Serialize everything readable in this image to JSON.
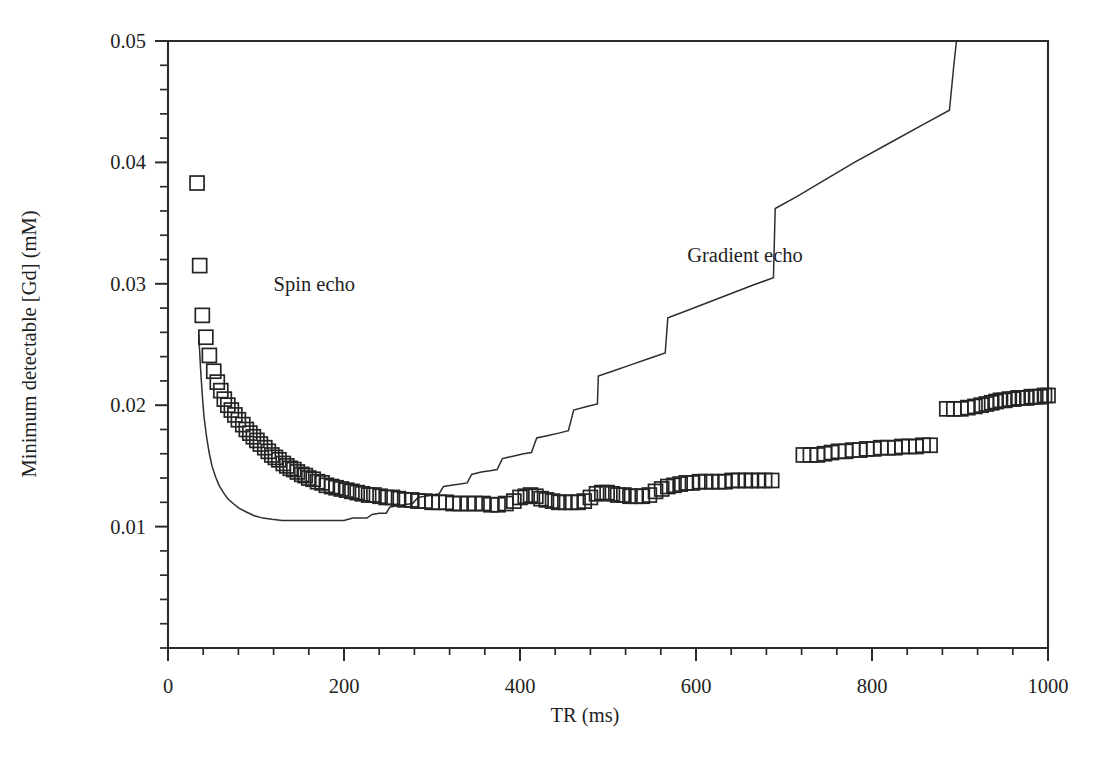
{
  "chart_data": {
    "type": "scatter",
    "title": "",
    "xlabel": "TR (ms)",
    "ylabel": "Minimum detectable [Gd] (mM)",
    "xlim": [
      0,
      1000
    ],
    "ylim": [
      0,
      0.05
    ],
    "grid": false,
    "legend_position": "inline-annotations",
    "x_ticks": [
      0,
      200,
      400,
      600,
      800,
      1000
    ],
    "x_tick_labels": [
      "0",
      "200",
      "400",
      "600",
      "800",
      "1000"
    ],
    "x_minor_tick_interval": 40,
    "y_ticks": [
      0.01,
      0.02,
      0.03,
      0.04,
      0.05
    ],
    "y_tick_labels": [
      "0.01",
      "0.02",
      "0.03",
      "0.04",
      "0.05"
    ],
    "y_minor_tick_interval": 0.002,
    "annotations": [
      {
        "text": "Spin echo",
        "x": 120,
        "y": 0.0294
      },
      {
        "text": "Gradient echo",
        "x": 590,
        "y": 0.0318
      }
    ],
    "series": [
      {
        "name": "Spin echo",
        "marker": "open-square",
        "marker_size": 14,
        "render": "markers",
        "points": [
          [
            33,
            0.0383
          ],
          [
            36,
            0.0315
          ],
          [
            39,
            0.0274
          ],
          [
            43,
            0.0256
          ],
          [
            47,
            0.0241
          ],
          [
            52,
            0.0228
          ],
          [
            56,
            0.0219
          ],
          [
            60,
            0.0212
          ],
          [
            64,
            0.0205
          ],
          [
            68,
            0.02
          ],
          [
            72,
            0.0196
          ],
          [
            76,
            0.0192
          ],
          [
            80,
            0.0188
          ],
          [
            85,
            0.0184
          ],
          [
            89,
            0.018
          ],
          [
            93,
            0.0177
          ],
          [
            97,
            0.0174
          ],
          [
            101,
            0.0171
          ],
          [
            105,
            0.0168
          ],
          [
            110,
            0.0165
          ],
          [
            114,
            0.0162
          ],
          [
            118,
            0.0159
          ],
          [
            122,
            0.0157
          ],
          [
            126,
            0.0155
          ],
          [
            131,
            0.0152
          ],
          [
            135,
            0.015
          ],
          [
            139,
            0.0148
          ],
          [
            143,
            0.0147
          ],
          [
            147,
            0.0145
          ],
          [
            152,
            0.0143
          ],
          [
            156,
            0.0142
          ],
          [
            160,
            0.014
          ],
          [
            165,
            0.0139
          ],
          [
            170,
            0.0137
          ],
          [
            175,
            0.0136
          ],
          [
            180,
            0.0134
          ],
          [
            186,
            0.0133
          ],
          [
            191,
            0.0132
          ],
          [
            197,
            0.0131
          ],
          [
            203,
            0.013
          ],
          [
            209,
            0.0129
          ],
          [
            215,
            0.0128
          ],
          [
            221,
            0.0127
          ],
          [
            228,
            0.0126
          ],
          [
            234,
            0.0126
          ],
          [
            241,
            0.0125
          ],
          [
            248,
            0.0124
          ],
          [
            255,
            0.0124
          ],
          [
            262,
            0.0123
          ],
          [
            269,
            0.0122
          ],
          [
            277,
            0.0122
          ],
          [
            284,
            0.0121
          ],
          [
            292,
            0.0121
          ],
          [
            300,
            0.012
          ],
          [
            308,
            0.012
          ],
          [
            316,
            0.012
          ],
          [
            324,
            0.0119
          ],
          [
            332,
            0.0119
          ],
          [
            341,
            0.0119
          ],
          [
            349,
            0.0119
          ],
          [
            358,
            0.0119
          ],
          [
            367,
            0.0118
          ],
          [
            375,
            0.0118
          ],
          [
            384,
            0.0119
          ],
          [
            393,
            0.0121
          ],
          [
            400,
            0.0124
          ],
          [
            406,
            0.0125
          ],
          [
            412,
            0.0126
          ],
          [
            418,
            0.0125
          ],
          [
            424,
            0.0123
          ],
          [
            430,
            0.0122
          ],
          [
            437,
            0.0121
          ],
          [
            444,
            0.012
          ],
          [
            451,
            0.012
          ],
          [
            458,
            0.012
          ],
          [
            466,
            0.012
          ],
          [
            473,
            0.0121
          ],
          [
            480,
            0.0124
          ],
          [
            487,
            0.0127
          ],
          [
            493,
            0.0128
          ],
          [
            499,
            0.0128
          ],
          [
            505,
            0.0127
          ],
          [
            511,
            0.0126
          ],
          [
            518,
            0.0126
          ],
          [
            525,
            0.0125
          ],
          [
            532,
            0.0125
          ],
          [
            539,
            0.0125
          ],
          [
            547,
            0.0126
          ],
          [
            554,
            0.0129
          ],
          [
            561,
            0.0131
          ],
          [
            568,
            0.0133
          ],
          [
            575,
            0.0134
          ],
          [
            582,
            0.0135
          ],
          [
            589,
            0.0136
          ],
          [
            596,
            0.0136
          ],
          [
            604,
            0.0137
          ],
          [
            611,
            0.0137
          ],
          [
            618,
            0.0137
          ],
          [
            626,
            0.0137
          ],
          [
            633,
            0.0137
          ],
          [
            641,
            0.0138
          ],
          [
            648,
            0.0138
          ],
          [
            656,
            0.0138
          ],
          [
            663,
            0.0138
          ],
          [
            671,
            0.0138
          ],
          [
            678,
            0.0138
          ],
          [
            686,
            0.0138
          ],
          [
            722,
            0.0159
          ],
          [
            730,
            0.0159
          ],
          [
            738,
            0.0159
          ],
          [
            746,
            0.016
          ],
          [
            754,
            0.0161
          ],
          [
            762,
            0.0162
          ],
          [
            770,
            0.0162
          ],
          [
            778,
            0.0163
          ],
          [
            786,
            0.0163
          ],
          [
            794,
            0.0164
          ],
          [
            802,
            0.0164
          ],
          [
            810,
            0.0165
          ],
          [
            818,
            0.0165
          ],
          [
            826,
            0.0165
          ],
          [
            834,
            0.0166
          ],
          [
            842,
            0.0166
          ],
          [
            850,
            0.0166
          ],
          [
            858,
            0.0167
          ],
          [
            866,
            0.0167
          ],
          [
            885,
            0.0197
          ],
          [
            893,
            0.0197
          ],
          [
            901,
            0.0197
          ],
          [
            909,
            0.0198
          ],
          [
            917,
            0.0199
          ],
          [
            924,
            0.02
          ],
          [
            930,
            0.0201
          ],
          [
            936,
            0.0202
          ],
          [
            941,
            0.0203
          ],
          [
            946,
            0.0204
          ],
          [
            951,
            0.0204
          ],
          [
            956,
            0.0205
          ],
          [
            961,
            0.0205
          ],
          [
            966,
            0.0206
          ],
          [
            971,
            0.0206
          ],
          [
            976,
            0.0206
          ],
          [
            981,
            0.0207
          ],
          [
            986,
            0.0207
          ],
          [
            991,
            0.0207
          ],
          [
            996,
            0.0208
          ],
          [
            1000,
            0.0208
          ]
        ]
      },
      {
        "name": "Gradient echo",
        "marker": "none",
        "render": "line",
        "points": [
          [
            35,
            0.0258
          ],
          [
            37,
            0.023
          ],
          [
            39,
            0.0208
          ],
          [
            41,
            0.019
          ],
          [
            44,
            0.0173
          ],
          [
            47,
            0.016
          ],
          [
            50,
            0.015
          ],
          [
            54,
            0.0141
          ],
          [
            58,
            0.0134
          ],
          [
            63,
            0.0128
          ],
          [
            68,
            0.0123
          ],
          [
            74,
            0.0119
          ],
          [
            81,
            0.0115
          ],
          [
            89,
            0.0112
          ],
          [
            98,
            0.0109
          ],
          [
            108,
            0.0107
          ],
          [
            118,
            0.0106
          ],
          [
            130,
            0.0105
          ],
          [
            145,
            0.0105
          ],
          [
            165,
            0.0105
          ],
          [
            185,
            0.0105
          ],
          [
            200,
            0.0105
          ],
          [
            210,
            0.0107
          ],
          [
            218,
            0.0107
          ],
          [
            226,
            0.0107
          ],
          [
            232,
            0.011
          ],
          [
            240,
            0.0111
          ],
          [
            248,
            0.0111
          ],
          [
            252,
            0.0116
          ],
          [
            258,
            0.0117
          ],
          [
            268,
            0.0118
          ],
          [
            278,
            0.0119
          ],
          [
            284,
            0.0124
          ],
          [
            292,
            0.0125
          ],
          [
            300,
            0.0126
          ],
          [
            308,
            0.0127
          ],
          [
            313,
            0.0133
          ],
          [
            322,
            0.0134
          ],
          [
            332,
            0.0135
          ],
          [
            340,
            0.0136
          ],
          [
            345,
            0.0143
          ],
          [
            356,
            0.0145
          ],
          [
            366,
            0.0146
          ],
          [
            374,
            0.0147
          ],
          [
            380,
            0.0156
          ],
          [
            392,
            0.0158
          ],
          [
            404,
            0.016
          ],
          [
            413,
            0.0161
          ],
          [
            419,
            0.0173
          ],
          [
            432,
            0.0175
          ],
          [
            444,
            0.0177
          ],
          [
            455,
            0.0179
          ],
          [
            461,
            0.0196
          ],
          [
            476,
            0.0199
          ],
          [
            488,
            0.0201
          ],
          [
            489,
            0.0224
          ],
          [
            505,
            0.0228
          ],
          [
            525,
            0.0233
          ],
          [
            545,
            0.0238
          ],
          [
            565,
            0.0243
          ],
          [
            568,
            0.0272
          ],
          [
            590,
            0.0278
          ],
          [
            615,
            0.0285
          ],
          [
            640,
            0.0292
          ],
          [
            665,
            0.0299
          ],
          [
            688,
            0.0305
          ],
          [
            690,
            0.0362
          ],
          [
            715,
            0.0372
          ],
          [
            745,
            0.0385
          ],
          [
            780,
            0.04
          ],
          [
            820,
            0.0416
          ],
          [
            860,
            0.0432
          ],
          [
            888,
            0.0443
          ],
          [
            893,
            0.048
          ],
          [
            896,
            0.051
          ]
        ]
      }
    ]
  },
  "figure": {
    "background_color": "#ffffff",
    "axis_color": "#2b2b2b",
    "marker_color": "#242424",
    "line_color": "#2e2e2e"
  }
}
